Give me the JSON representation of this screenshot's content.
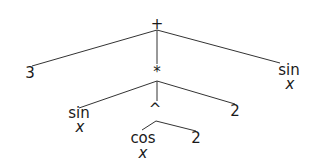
{
  "diagram": {
    "type": "expression-tree",
    "expression": "3 + (sin x * (cos x ^ 2) * 2) + sin x",
    "nodes": {
      "root": {
        "label": "+"
      },
      "three": {
        "label": "3"
      },
      "mult": {
        "label": "*"
      },
      "sin_right": {
        "label": "sin",
        "arg": "x"
      },
      "sin_left": {
        "label": "sin",
        "arg": "x"
      },
      "pow": {
        "label": "^"
      },
      "two_mult": {
        "label": "2"
      },
      "cos": {
        "label": "cos",
        "arg": "x"
      },
      "two_pow": {
        "label": "2"
      }
    },
    "edges": [
      [
        "root",
        "three"
      ],
      [
        "root",
        "mult"
      ],
      [
        "root",
        "sin_right"
      ],
      [
        "mult",
        "sin_left"
      ],
      [
        "mult",
        "pow"
      ],
      [
        "mult",
        "two_mult"
      ],
      [
        "pow",
        "cos"
      ],
      [
        "pow",
        "two_pow"
      ]
    ],
    "colors": {
      "line": "#333333",
      "text": "#1a1a1a",
      "background": "#ffffff"
    }
  }
}
